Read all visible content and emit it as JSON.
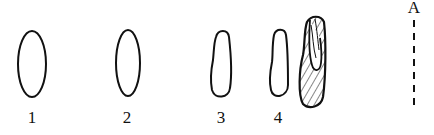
{
  "diagram": {
    "stroke_color": "#111111",
    "background": "#ffffff",
    "shapes": [
      {
        "id": "1",
        "label": "1",
        "kind": "ellipse-outline"
      },
      {
        "id": "2",
        "label": "2",
        "kind": "ellipse-outline"
      },
      {
        "id": "3",
        "label": "3",
        "kind": "elongated-outline"
      },
      {
        "id": "4",
        "label": "4",
        "kind": "narrow-elongated-outline"
      },
      {
        "id": "5",
        "label": "",
        "kind": "hatched-elongated-with-inner-loop"
      }
    ],
    "axis": {
      "label": "A",
      "style": "dashed-vertical"
    }
  }
}
